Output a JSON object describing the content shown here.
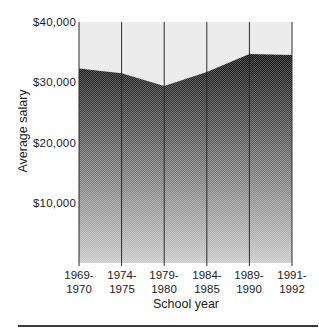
{
  "page": {
    "background": "#ffffff"
  },
  "chart_data": {
    "type": "area",
    "title": "",
    "series_name": "Average salary",
    "ylabel": "Average salary",
    "xlabel": "School year",
    "ylim": [
      0,
      40000
    ],
    "yticks": [
      "$40,000",
      "$30,000",
      "$20,000",
      "$10,000"
    ],
    "ytick_values": [
      40000,
      30000,
      20000,
      10000
    ],
    "categories": [
      {
        "line1": "1969-",
        "line2": "1970"
      },
      {
        "line1": "1974-",
        "line2": "1975"
      },
      {
        "line1": "1979-",
        "line2": "1980"
      },
      {
        "line1": "1984-",
        "line2": "1985"
      },
      {
        "line1": "1989-",
        "line2": "1990"
      },
      {
        "line1": "1991-",
        "line2": "1992"
      }
    ],
    "values": [
      32300,
      31500,
      29400,
      31700,
      34700,
      34500
    ],
    "grid": "vertical gridline at each category, no horizontal gridlines",
    "legend": "none",
    "colors": {
      "upper_area": "#e9e9e9",
      "area_gradient_top": "#0d0d0d",
      "area_gradient_bottom": "#c9c9c9",
      "gridline": "#2b2b2b",
      "text": "#1c1c1c",
      "bottom_rule": "#3a3a3a"
    }
  }
}
